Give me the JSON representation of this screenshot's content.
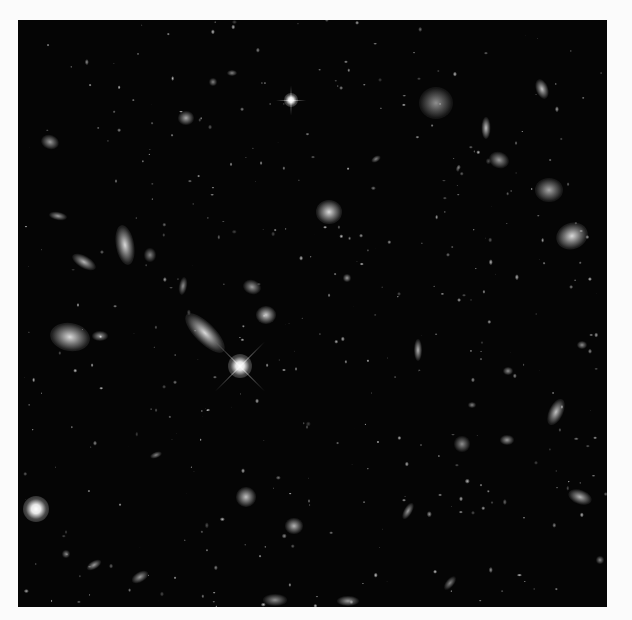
{
  "image": {
    "subject": "deep field of galaxies (grayscale)",
    "frame": {
      "left": 18,
      "top": 20,
      "width": 589,
      "height": 587,
      "background": "#050505",
      "border_color": "#fbfbfb"
    }
  },
  "stars": [
    {
      "x": 240,
      "y": 366,
      "r": 12,
      "spike": 70,
      "angles": [
        45,
        135
      ]
    },
    {
      "x": 291,
      "y": 100,
      "r": 7,
      "spike": 30,
      "angles": [
        0,
        90
      ]
    },
    {
      "x": 36,
      "y": 509,
      "r": 13,
      "spike": 0,
      "angles": []
    }
  ],
  "galaxies": [
    {
      "x": 205,
      "y": 333,
      "w": 52,
      "h": 20,
      "rot": 45,
      "b": 0.85
    },
    {
      "x": 266,
      "y": 315,
      "w": 20,
      "h": 18,
      "rot": 0,
      "b": 0.8
    },
    {
      "x": 252,
      "y": 287,
      "w": 18,
      "h": 14,
      "rot": 20,
      "b": 0.6
    },
    {
      "x": 70,
      "y": 337,
      "w": 40,
      "h": 28,
      "rot": 10,
      "b": 0.85
    },
    {
      "x": 100,
      "y": 336,
      "w": 16,
      "h": 10,
      "rot": 0,
      "b": 0.6
    },
    {
      "x": 125,
      "y": 245,
      "w": 18,
      "h": 40,
      "rot": -10,
      "b": 0.85
    },
    {
      "x": 150,
      "y": 255,
      "w": 12,
      "h": 14,
      "rot": 0,
      "b": 0.5
    },
    {
      "x": 84,
      "y": 262,
      "w": 26,
      "h": 12,
      "rot": 30,
      "b": 0.7
    },
    {
      "x": 58,
      "y": 216,
      "w": 18,
      "h": 8,
      "rot": 10,
      "b": 0.6
    },
    {
      "x": 183,
      "y": 286,
      "w": 8,
      "h": 18,
      "rot": 10,
      "b": 0.55
    },
    {
      "x": 186,
      "y": 118,
      "w": 16,
      "h": 14,
      "rot": 0,
      "b": 0.65
    },
    {
      "x": 50,
      "y": 142,
      "w": 18,
      "h": 14,
      "rot": 20,
      "b": 0.6
    },
    {
      "x": 436,
      "y": 103,
      "w": 34,
      "h": 32,
      "rot": 0,
      "b": 0.55
    },
    {
      "x": 486,
      "y": 128,
      "w": 9,
      "h": 22,
      "rot": 0,
      "b": 0.75
    },
    {
      "x": 499,
      "y": 160,
      "w": 20,
      "h": 16,
      "rot": 20,
      "b": 0.6
    },
    {
      "x": 542,
      "y": 89,
      "w": 12,
      "h": 20,
      "rot": -20,
      "b": 0.75
    },
    {
      "x": 549,
      "y": 190,
      "w": 28,
      "h": 24,
      "rot": 0,
      "b": 0.65
    },
    {
      "x": 572,
      "y": 236,
      "w": 32,
      "h": 26,
      "rot": -20,
      "b": 0.85
    },
    {
      "x": 329,
      "y": 212,
      "w": 26,
      "h": 24,
      "rot": 0,
      "b": 0.85
    },
    {
      "x": 347,
      "y": 278,
      "w": 8,
      "h": 8,
      "rot": 0,
      "b": 0.6
    },
    {
      "x": 418,
      "y": 350,
      "w": 8,
      "h": 22,
      "rot": 0,
      "b": 0.7
    },
    {
      "x": 556,
      "y": 412,
      "w": 14,
      "h": 28,
      "rot": 25,
      "b": 0.75
    },
    {
      "x": 462,
      "y": 444,
      "w": 16,
      "h": 16,
      "rot": 0,
      "b": 0.55
    },
    {
      "x": 507,
      "y": 440,
      "w": 14,
      "h": 10,
      "rot": 0,
      "b": 0.6
    },
    {
      "x": 580,
      "y": 497,
      "w": 24,
      "h": 14,
      "rot": 20,
      "b": 0.7
    },
    {
      "x": 246,
      "y": 497,
      "w": 20,
      "h": 20,
      "rot": 0,
      "b": 0.75
    },
    {
      "x": 294,
      "y": 526,
      "w": 18,
      "h": 16,
      "rot": 0,
      "b": 0.7
    },
    {
      "x": 408,
      "y": 511,
      "w": 8,
      "h": 18,
      "rot": 30,
      "b": 0.6
    },
    {
      "x": 348,
      "y": 601,
      "w": 22,
      "h": 10,
      "rot": 0,
      "b": 0.6
    },
    {
      "x": 275,
      "y": 600,
      "w": 24,
      "h": 12,
      "rot": 0,
      "b": 0.55
    },
    {
      "x": 94,
      "y": 565,
      "w": 16,
      "h": 8,
      "rot": -30,
      "b": 0.6
    },
    {
      "x": 140,
      "y": 577,
      "w": 18,
      "h": 10,
      "rot": -30,
      "b": 0.6
    },
    {
      "x": 66,
      "y": 554,
      "w": 8,
      "h": 8,
      "rot": 0,
      "b": 0.5
    },
    {
      "x": 376,
      "y": 159,
      "w": 10,
      "h": 6,
      "rot": -30,
      "b": 0.5
    },
    {
      "x": 232,
      "y": 73,
      "w": 10,
      "h": 6,
      "rot": 0,
      "b": 0.5
    },
    {
      "x": 213,
      "y": 82,
      "w": 8,
      "h": 8,
      "rot": 0,
      "b": 0.5
    },
    {
      "x": 472,
      "y": 405,
      "w": 8,
      "h": 6,
      "rot": 0,
      "b": 0.5
    },
    {
      "x": 582,
      "y": 345,
      "w": 10,
      "h": 8,
      "rot": 0,
      "b": 0.55
    },
    {
      "x": 600,
      "y": 560,
      "w": 8,
      "h": 8,
      "rot": 0,
      "b": 0.5
    },
    {
      "x": 156,
      "y": 455,
      "w": 12,
      "h": 6,
      "rot": -20,
      "b": 0.5
    },
    {
      "x": 450,
      "y": 583,
      "w": 8,
      "h": 16,
      "rot": 40,
      "b": 0.5
    },
    {
      "x": 508,
      "y": 371,
      "w": 10,
      "h": 8,
      "rot": 0,
      "b": 0.55
    }
  ],
  "dust_seed": 17,
  "dust_count": 420
}
